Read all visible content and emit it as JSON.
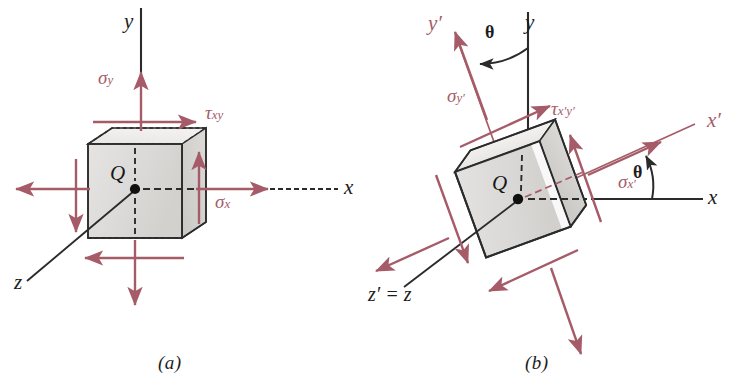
{
  "figure": {
    "accent_color": "#a65c68",
    "ink_color": "#2b2b2b",
    "face_fill": "#dedcda",
    "face_fill_light": "#ebeae8",
    "face_fill_dark": "#cfcdca"
  },
  "panels": [
    {
      "id": "a",
      "caption": "(a)",
      "point_label": "Q",
      "axes": [
        {
          "name": "y-axis",
          "label": "y",
          "color": "#1d1d1d",
          "orientation": "vertical"
        },
        {
          "name": "x-axis",
          "label": "x",
          "color": "#1d1d1d",
          "orientation": "horizontal"
        },
        {
          "name": "z-axis",
          "label": "z",
          "color": "#1d1d1d",
          "orientation": "diagonal-down-left"
        }
      ],
      "stresses": [
        {
          "name": "sigma-y",
          "symbol": "σ",
          "subscript": "y",
          "kind": "normal"
        },
        {
          "name": "sigma-x",
          "symbol": "σ",
          "subscript": "x",
          "kind": "normal"
        },
        {
          "name": "tau-xy",
          "symbol": "τ",
          "subscript": "xy",
          "kind": "shear"
        }
      ]
    },
    {
      "id": "b",
      "caption": "(b)",
      "point_label": "Q",
      "rotation_deg": 20,
      "axes": [
        {
          "name": "y-axis",
          "label": "y",
          "color": "#1d1d1d",
          "orientation": "vertical"
        },
        {
          "name": "x-axis",
          "label": "x",
          "color": "#1d1d1d",
          "orientation": "horizontal"
        },
        {
          "name": "y-prime-axis",
          "label": "y′",
          "color": "#a65c68",
          "orientation": "rotated-vertical"
        },
        {
          "name": "x-prime-axis",
          "label": "x′",
          "color": "#a65c68",
          "orientation": "rotated-horizontal"
        },
        {
          "name": "z-prime-axis",
          "label": "z′ = z",
          "color": "#1d1d1d",
          "orientation": "diagonal-down-left"
        }
      ],
      "angles": [
        {
          "name": "theta-top",
          "label": "θ"
        },
        {
          "name": "theta-right",
          "label": "θ"
        }
      ],
      "stresses": [
        {
          "name": "sigma-y-prime",
          "symbol": "σ",
          "subscript": "y′",
          "kind": "normal"
        },
        {
          "name": "sigma-x-prime",
          "symbol": "σ",
          "subscript": "x′",
          "kind": "normal"
        },
        {
          "name": "tau-xy-prime",
          "symbol": "τ",
          "subscript": "x′y′",
          "kind": "shear"
        }
      ]
    }
  ],
  "labels": {
    "a_caption": "(a)",
    "b_caption": "(b)",
    "q": "Q",
    "y": "y",
    "x": "x",
    "z": "z",
    "zprime_eq_z": "z′ = z",
    "yprime": "y′",
    "xprime": "x′",
    "theta": "θ",
    "sigma": "σ",
    "tau": "τ",
    "sub_y": "y",
    "sub_x": "x",
    "sub_xy": "xy",
    "sub_yp": "y′",
    "sub_xp": "x′",
    "sub_xpyp": "x′y′"
  }
}
